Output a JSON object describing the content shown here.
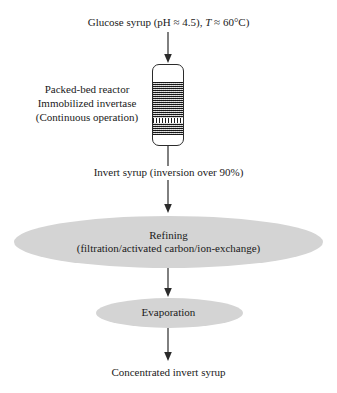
{
  "diagram": {
    "background_color": "#ffffff",
    "shape_fill_color": "#d4d4d4",
    "line_color": "#2b2b2b"
  },
  "feed": {
    "label_prefix": "Glucose syrup (pH ≈ 4.5), ",
    "temp_symbol": "T",
    "label_suffix": " ≈ 60°C)",
    "full_label": "Glucose syrup (pH ≈ 4.5), T ≈ 60°C)",
    "ph_value": "4.5",
    "temperature_value": "60°C"
  },
  "reactor": {
    "label_line1": "Packed-bed reactor",
    "label_line2": "Immobilized invertase",
    "label_line3": "(Continuous operation)",
    "vessel_name": "packed-bed-reactor-vessel",
    "bed_fill_name": "immobilized-enzyme-bed"
  },
  "intermediate": {
    "invert_syrup_label": "Invert  syrup (inversion over 90%)",
    "inversion_percent": "over 90%"
  },
  "refining": {
    "title": "Refining",
    "subtitle": "(filtration/activated carbon/ion-exchange)"
  },
  "evaporation": {
    "title": "Evaporation"
  },
  "product": {
    "label": "Concentrated invert syrup"
  },
  "arrows": {
    "feed_to_reactor": "arrow-down",
    "reactor_to_refining": "arrow-down",
    "refining_to_evaporation": "arrow-down",
    "evaporation_to_product": "arrow-down"
  }
}
